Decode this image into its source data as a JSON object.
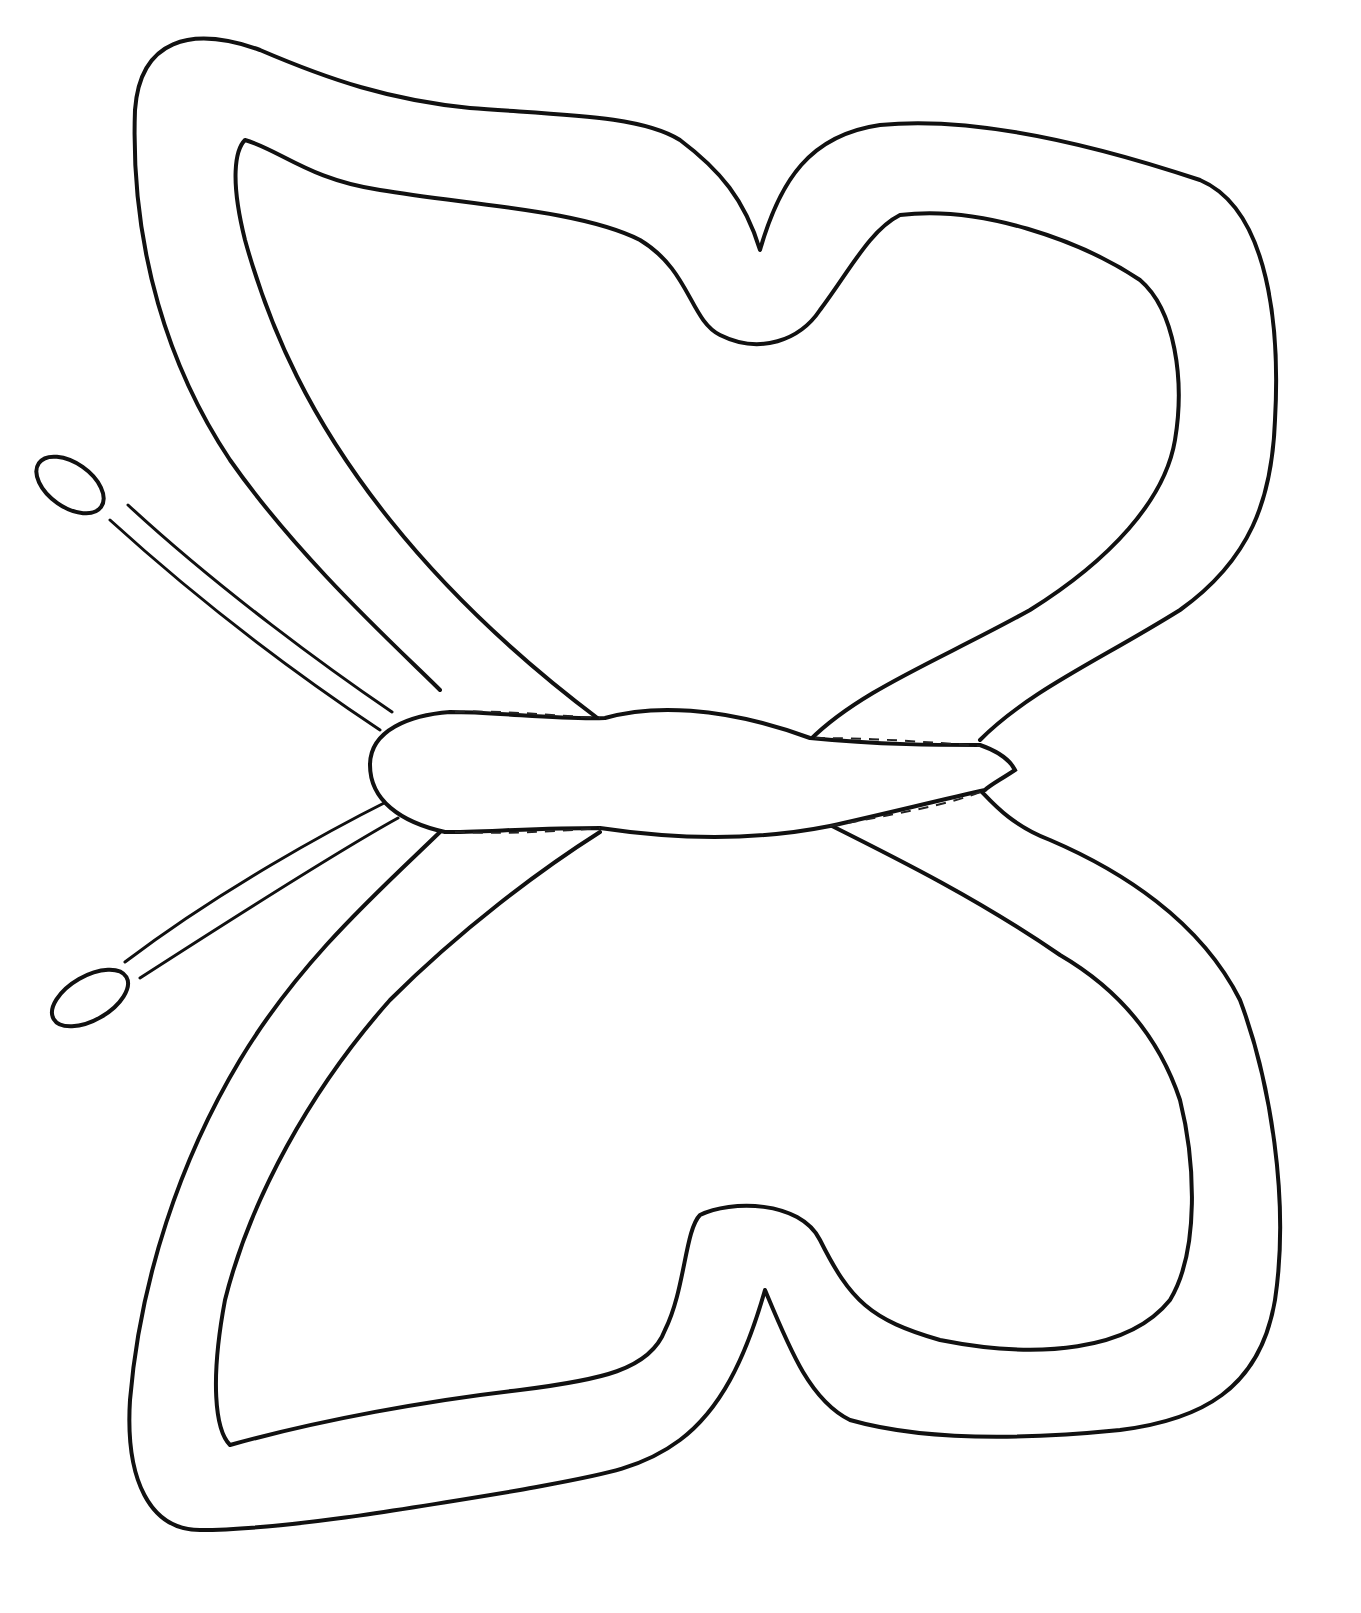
{
  "page": {
    "background_color": "#ffffff",
    "line_color": "#111111"
  },
  "drawing": {
    "parts": [
      "upper-wing",
      "lower-wing",
      "body",
      "antenna-upper",
      "antenna-lower"
    ]
  }
}
